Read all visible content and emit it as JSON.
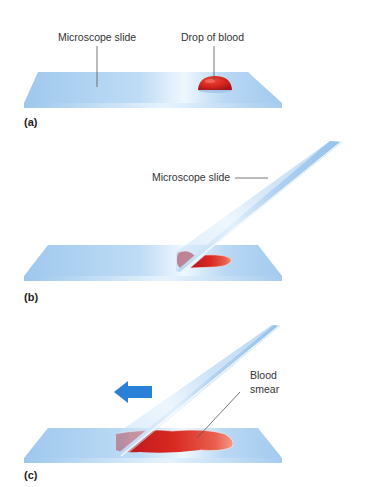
{
  "figure": {
    "panels": [
      {
        "id": "a",
        "label": "(a)",
        "callouts": [
          "Microscope slide",
          "Drop of blood"
        ]
      },
      {
        "id": "b",
        "label": "(b)",
        "callouts": [
          "Microscope slide"
        ]
      },
      {
        "id": "c",
        "label": "(c)",
        "callouts": [
          "Blood",
          "smear"
        ]
      }
    ]
  },
  "colors": {
    "slide_top": "#a8cef0",
    "slide_highlight": "#eaf5fd",
    "slide_edge": "#cfe5f7",
    "blood": "#d42a22",
    "blood_dark": "#a8151a",
    "arrow": "#2a7fd8",
    "leader_line": "#555555"
  },
  "icons": {
    "direction_arrow": "left-arrow-icon"
  }
}
